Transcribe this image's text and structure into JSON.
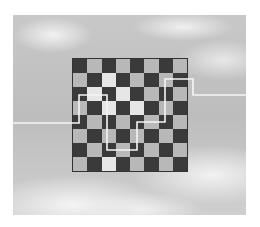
{
  "scene": {
    "description": "Grayscale photo of a checkerboard floating against a cloudy sky with a white line path crossing it",
    "colors": {
      "dark_square": "#3a3a3a",
      "light_square": "#b8b8b8",
      "highlight_square": "#e6e6e6",
      "path": "#f5f5f5",
      "sky": "#c4c4c4"
    },
    "board": {
      "rows": 8,
      "cols": 8
    },
    "highlight_squares": [
      [
        1,
        2
      ],
      [
        2,
        1
      ],
      [
        2,
        3
      ],
      [
        3,
        2
      ],
      [
        3,
        4
      ],
      [
        3,
        1
      ],
      [
        5,
        1
      ],
      [
        7,
        2
      ],
      [
        6,
        6
      ]
    ],
    "path_points": "13,123 79,123 79,95 107,95 107,150 137,150 137,122 165,122 165,79 193,79 193,95 246,95"
  }
}
